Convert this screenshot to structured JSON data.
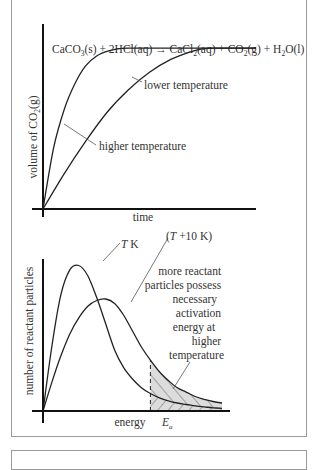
{
  "header": {
    "cut_text": "The effect of temperature"
  },
  "chart_data": [
    {
      "type": "line",
      "title": "CaCO3(s) + 2HCl(aq) → CaCl2(aq) + CO2(g) + H2O(l)",
      "equation": {
        "parts": [
          "CaCO",
          "3",
          "(s) + 2HCl(aq) → CaCl",
          "2",
          "(aq) + CO",
          "2",
          "(g) + H",
          "2",
          "O(l)"
        ]
      },
      "xlabel": "time",
      "ylabel": "volume of CO₂(g)",
      "ylabel_parts": [
        "volume of CO",
        "2",
        "(g)"
      ],
      "xlim": [
        0,
        10
      ],
      "ylim": [
        0,
        1.15
      ],
      "grid": false,
      "series": [
        {
          "name": "higher temperature",
          "x": [
            0,
            0.5,
            1,
            1.5,
            2,
            2.5,
            3,
            3.5,
            4,
            5,
            6,
            7,
            8,
            9,
            10
          ],
          "y": [
            0,
            0.38,
            0.62,
            0.78,
            0.89,
            0.95,
            0.98,
            0.995,
            1.0,
            1.0,
            1.0,
            1.0,
            1.0,
            1.0,
            1.0
          ]
        },
        {
          "name": "lower temperature",
          "x": [
            0,
            1,
            2,
            3,
            4,
            5,
            6,
            7,
            7.5,
            8,
            9,
            10
          ],
          "y": [
            0,
            0.22,
            0.42,
            0.6,
            0.74,
            0.85,
            0.93,
            0.98,
            0.995,
            1.0,
            1.0,
            1.0
          ]
        }
      ],
      "annotations": [
        {
          "text": "lower temperature",
          "target_series": "lower temperature"
        },
        {
          "text": "higher temperature",
          "target_series": "higher temperature"
        }
      ]
    },
    {
      "type": "line",
      "title": "",
      "xlabel": "energy",
      "ylabel": "number of reactant particles",
      "xlim": [
        0,
        10
      ],
      "ylim": [
        0,
        1.1
      ],
      "grid": false,
      "series": [
        {
          "name": "T K",
          "label_parts": [
            "T",
            " K"
          ],
          "x": [
            0,
            0.5,
            1,
            1.5,
            2,
            2.5,
            3,
            3.5,
            4,
            4.5,
            5,
            5.5,
            6,
            6.5,
            7,
            7.5,
            8,
            8.5,
            9,
            9.5,
            10
          ],
          "y": [
            0,
            0.45,
            0.8,
            0.97,
            1.0,
            0.93,
            0.78,
            0.6,
            0.42,
            0.3,
            0.22,
            0.16,
            0.12,
            0.09,
            0.07,
            0.055,
            0.045,
            0.035,
            0.028,
            0.022,
            0.018
          ]
        },
        {
          "name": "(T + 10 K)",
          "label_parts": [
            "(",
            "T",
            " +10 K)"
          ],
          "x": [
            0,
            0.5,
            1,
            1.5,
            2,
            2.5,
            3,
            3.5,
            4,
            4.5,
            5,
            5.5,
            6,
            6.5,
            7,
            7.5,
            8,
            8.5,
            9,
            9.5,
            10
          ],
          "y": [
            0,
            0.2,
            0.38,
            0.53,
            0.64,
            0.72,
            0.76,
            0.77,
            0.74,
            0.66,
            0.55,
            0.44,
            0.35,
            0.27,
            0.21,
            0.16,
            0.13,
            0.1,
            0.08,
            0.065,
            0.055
          ]
        }
      ],
      "threshold": {
        "name": "Ea",
        "label_main": "E",
        "label_sub": "a",
        "x": 6,
        "style": "dashed"
      },
      "annotations": [
        {
          "text_lines": [
            "more reactant",
            "particles possess",
            "necessary",
            "activation",
            "energy at",
            "higher",
            "temperature"
          ],
          "points_to": "hatched region between curves right of Ea"
        }
      ],
      "shading": {
        "color": "#dcdcdc",
        "hatch_color": "#555555"
      }
    }
  ]
}
